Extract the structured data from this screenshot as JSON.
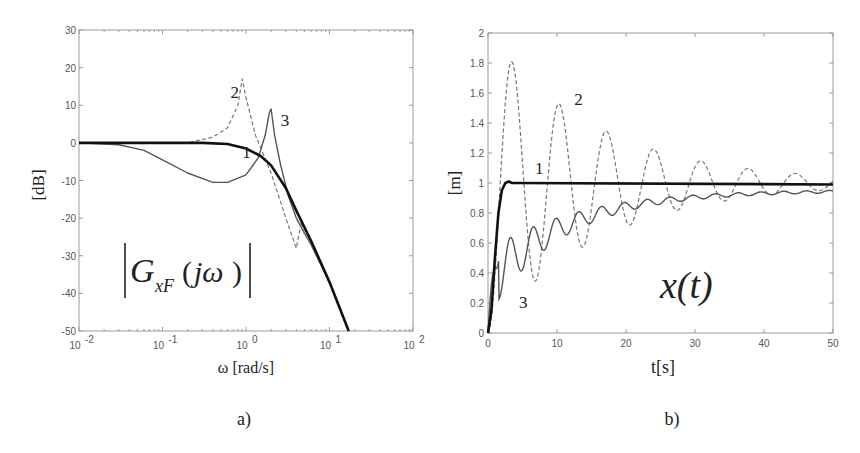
{
  "chart_data": [
    {
      "id": "a",
      "type": "line",
      "panel_label": "a)",
      "title": "|G_xF(jω)|",
      "annotation": "|G_xF(jω)|",
      "xlabel": "ω [rad/s]",
      "ylabel": "[dB]",
      "xscale": "log",
      "xlim": [
        0.01,
        100
      ],
      "ylim": [
        -50,
        30
      ],
      "xticks": [
        "10^-2",
        "10^-1",
        "10^0",
        "10^1",
        "10^2"
      ],
      "yticks": [
        30,
        20,
        10,
        0,
        -10,
        -20,
        -30,
        -40,
        -50
      ],
      "grid": false,
      "series": [
        {
          "name": "1",
          "style": "thick solid black",
          "x": [
            0.01,
            0.1,
            0.3,
            0.6,
            1.0,
            1.5,
            2.0,
            3.0,
            4.0,
            6.0,
            10.0,
            17.0
          ],
          "y": [
            0,
            0,
            0,
            -0.3,
            -1.5,
            -3.5,
            -6,
            -12,
            -18,
            -26,
            -37,
            -50
          ]
        },
        {
          "name": "2",
          "style": "dashed grey",
          "x": [
            0.01,
            0.1,
            0.2,
            0.4,
            0.6,
            0.8,
            0.9,
            1.0,
            1.3,
            2.0,
            3.0,
            4.0,
            4.6,
            5.0,
            6.0,
            10.0,
            17.0
          ],
          "y": [
            0,
            0,
            0,
            1.5,
            4,
            10,
            17,
            12,
            2,
            -8,
            -20,
            -28,
            -21,
            -24,
            -27,
            -37,
            -50
          ]
        },
        {
          "name": "3",
          "style": "thin solid grey",
          "x": [
            0.01,
            0.03,
            0.06,
            0.1,
            0.2,
            0.4,
            0.6,
            1.0,
            1.4,
            1.7,
            1.9,
            2.0,
            2.2,
            2.6,
            3.2,
            4.0,
            5.0,
            6.0,
            10.0,
            17.0
          ],
          "y": [
            0,
            -0.5,
            -2,
            -4.5,
            -8,
            -10.5,
            -10.5,
            -8.5,
            -4,
            2,
            8,
            9,
            2,
            -6,
            -14,
            -20,
            -24,
            -27,
            -37,
            -50
          ]
        }
      ],
      "labels": [
        {
          "text": "1",
          "x": 0.9,
          "y": -4
        },
        {
          "text": "2",
          "x": 0.65,
          "y": 12
        },
        {
          "text": "3",
          "x": 2.6,
          "y": 4.5
        }
      ]
    },
    {
      "id": "b",
      "type": "line",
      "panel_label": "b)",
      "title": "x(t)",
      "annotation": "x(t)",
      "xlabel": "t[s]",
      "ylabel": "[m]",
      "xlim": [
        0,
        50
      ],
      "ylim": [
        0,
        2
      ],
      "xticks": [
        0,
        10,
        20,
        30,
        40,
        50
      ],
      "yticks": [
        0,
        0.2,
        0.4,
        0.6,
        0.8,
        1,
        1.2,
        1.4,
        1.6,
        1.8,
        2
      ],
      "grid": false,
      "series": [
        {
          "name": "1",
          "style": "thick solid black",
          "x": [
            0,
            0.5,
            1.0,
            1.5,
            2.0,
            2.5,
            3.0,
            3.5,
            4,
            50
          ],
          "y": [
            0,
            0.15,
            0.5,
            0.8,
            0.95,
            1.0,
            1.01,
            1.0,
            1.0,
            0.99
          ]
        },
        {
          "name": "2",
          "style": "dashed grey",
          "damped_oscillation": {
            "final": 1.0,
            "peaks": [
              [
                3.4,
                1.81
              ],
              [
                10.3,
                1.53
              ],
              [
                17.1,
                1.35
              ],
              [
                24.0,
                1.23
              ],
              [
                30.9,
                1.15
              ],
              [
                37.7,
                1.1
              ],
              [
                44.6,
                1.06
              ]
            ],
            "troughs": [
              [
                6.8,
                0.34
              ],
              [
                13.7,
                0.58
              ],
              [
                20.5,
                0.72
              ],
              [
                27.4,
                0.81
              ],
              [
                34.3,
                0.87
              ],
              [
                41.1,
                0.91
              ],
              [
                48.0,
                0.93
              ]
            ]
          }
        },
        {
          "name": "3",
          "style": "thin solid grey",
          "oscillation": {
            "period": 3.3,
            "start_peak": [
              1.6,
              0.53
            ],
            "first_trough": [
              3.1,
              0.19
            ],
            "trend_end": 0.95
          }
        }
      ],
      "labels": [
        {
          "text": "1",
          "x": 6.8,
          "y": 1.06
        },
        {
          "text": "2",
          "x": 12.5,
          "y": 1.52
        },
        {
          "text": "3",
          "x": 4.5,
          "y": 0.17
        }
      ]
    }
  ]
}
